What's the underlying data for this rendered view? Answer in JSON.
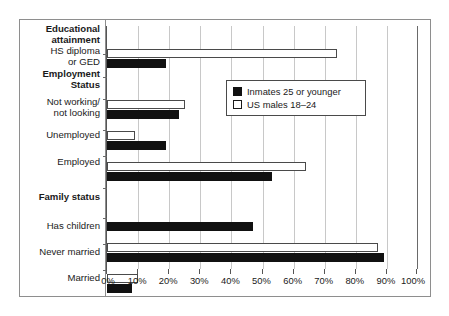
{
  "chart_data": {
    "type": "bar",
    "orientation": "horizontal",
    "title": "",
    "subtitle": "",
    "xlabel": "",
    "ylabel": "",
    "xlim": [
      0,
      100
    ],
    "x_tick_labels": [
      "0%",
      "10%",
      "20%",
      "30%",
      "40%",
      "50%",
      "60%",
      "70%",
      "80%",
      "90%",
      "100%"
    ],
    "x_tick_values": [
      0,
      10,
      20,
      30,
      40,
      50,
      60,
      70,
      80,
      90,
      100
    ],
    "grid": true,
    "legend_position": "top-right",
    "series": [
      {
        "name": "Inmates 25 or younger",
        "color": "#111111",
        "style": "filled",
        "values": [
          19,
          null,
          23,
          19,
          53,
          null,
          47,
          89,
          8
        ]
      },
      {
        "name": "US males 18–24",
        "color": "#ffffff",
        "style": "outlined",
        "values": [
          74,
          null,
          25,
          9,
          64,
          null,
          null,
          87,
          10
        ]
      }
    ],
    "categories": [
      "HS diploma\nor GED",
      "Employment\nStatus",
      "Not working/\nnot looking",
      "Unemployed",
      "Employed",
      "Family status",
      "Has children",
      "Never married",
      "Married"
    ],
    "group_headers": [
      "Educational\nattainment",
      "Employment\nStatus",
      "Family status"
    ]
  },
  "groups": [
    {
      "label": "Educational\nattainment",
      "is_group": true
    },
    {
      "label": "HS diploma\nor GED",
      "is_group": false
    },
    {
      "label": "Employment\nStatus",
      "is_group": true
    },
    {
      "label": "Not working/\nnot looking",
      "is_group": false
    },
    {
      "label": "Unemployed",
      "is_group": false
    },
    {
      "label": "Employed",
      "is_group": false
    },
    {
      "label": "Family status",
      "is_group": true
    },
    {
      "label": "Has children",
      "is_group": false
    },
    {
      "label": "Never married",
      "is_group": false
    },
    {
      "label": "Married",
      "is_group": false
    }
  ],
  "legend": {
    "items": [
      {
        "label": "Inmates 25 or younger",
        "swatch": "filled-black-square"
      },
      {
        "label": "US males 18–24",
        "swatch": "outlined-white-square"
      }
    ]
  },
  "axis": {
    "ticks": [
      "0%",
      "10%",
      "20%",
      "30%",
      "40%",
      "50%",
      "60%",
      "70%",
      "80%",
      "90%",
      "100%"
    ]
  },
  "colors": {
    "inmates": "#111111",
    "us_males": "#ffffff",
    "grid": "#c8c8c8",
    "frame": "#8e8e8e",
    "text": "#1a1a1a"
  }
}
